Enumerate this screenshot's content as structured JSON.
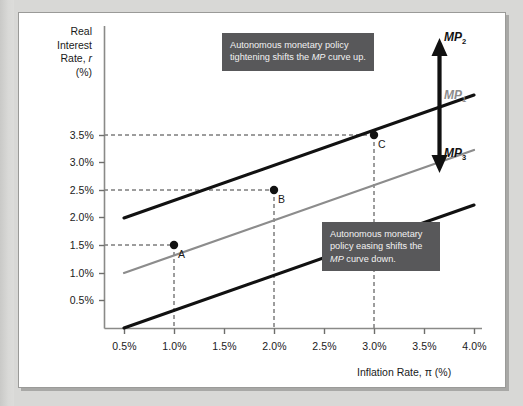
{
  "figure": {
    "y_axis_title_lines": [
      "Real",
      "Interest",
      "Rate, r",
      "(%)"
    ],
    "y_axis_title_italic_part": "r",
    "x_axis_title": "Inflation Rate, π (%)"
  },
  "chart_data": {
    "type": "line",
    "title": "",
    "xlabel": "Inflation Rate, π (%)",
    "ylabel": "Real Interest Rate, r (%)",
    "xlim": [
      0.0,
      4.25
    ],
    "ylim": [
      0.0,
      4.35
    ],
    "xticks": [
      "0.5%",
      "1.0%",
      "1.5%",
      "2.0%",
      "2.5%",
      "3.0%",
      "3.5%",
      "4.0%"
    ],
    "xtick_values": [
      0.5,
      1.0,
      1.5,
      2.0,
      2.5,
      3.0,
      3.5,
      4.0
    ],
    "yticks": [
      "0.5%",
      "1.0%",
      "1.5%",
      "2.0%",
      "2.5%",
      "3.0%",
      "3.5%"
    ],
    "ytick_values": [
      0.5,
      1.0,
      1.5,
      2.0,
      2.5,
      3.0,
      3.5
    ],
    "grid": false,
    "legend_position": "right-inline",
    "series": [
      {
        "name": "MP2",
        "label": "MP",
        "subscript": "2",
        "color": "#111111",
        "width": 3.0,
        "x": [
          0.5,
          4.0
        ],
        "y": [
          2.0,
          4.25
        ],
        "note": "autonomous tightening: shifted up by 1.0 pt from MP1"
      },
      {
        "name": "MP1",
        "label": "MP",
        "subscript": "1",
        "color": "#8c8c8c",
        "width": 2.2,
        "x": [
          0.5,
          4.0
        ],
        "y": [
          1.0,
          3.25
        ],
        "note": "baseline monetary policy curve; contains points A, B, C"
      },
      {
        "name": "MP3",
        "label": "MP",
        "subscript": "3",
        "color": "#111111",
        "width": 3.0,
        "x": [
          0.5,
          4.0
        ],
        "y": [
          0.0,
          2.25
        ],
        "note": "autonomous easing: shifted down by 1.0 pt from MP1"
      }
    ],
    "points": [
      {
        "label": "A",
        "x": 1.0,
        "y": 1.5,
        "on_series": "MP1"
      },
      {
        "label": "B",
        "x": 2.0,
        "y": 2.5,
        "on_series": "MP1"
      },
      {
        "label": "C",
        "x": 3.0,
        "y": 3.5,
        "on_series": "MP1"
      }
    ],
    "guide_lines": [
      {
        "type": "horizontal",
        "y": 1.5,
        "from_x": 0.0,
        "to_x": 1.0
      },
      {
        "type": "horizontal",
        "y": 2.5,
        "from_x": 0.0,
        "to_x": 2.0
      },
      {
        "type": "horizontal",
        "y": 3.5,
        "from_x": 0.0,
        "to_x": 3.0
      },
      {
        "type": "vertical",
        "x": 1.0,
        "from_y": 0.0,
        "to_y": 1.5
      },
      {
        "type": "vertical",
        "x": 2.0,
        "from_y": 0.0,
        "to_y": 2.5
      },
      {
        "type": "vertical",
        "x": 3.0,
        "from_y": 0.0,
        "to_y": 3.5
      }
    ],
    "annotations": [
      {
        "id": "tightening",
        "text_lines": [
          "Autonomous monetary policy",
          "tightening shifts the MP curve up."
        ],
        "italic_token": "MP",
        "box_color": "#58585a",
        "text_color": "#f2f2f2"
      },
      {
        "id": "easing",
        "text_lines": [
          "Autonomous monetary",
          "policy easing shifts the",
          "MP curve down."
        ],
        "italic_token": "MP",
        "box_color": "#58585a",
        "text_color": "#f2f2f2"
      }
    ],
    "arrows": [
      {
        "id": "shift-arrow",
        "style": "double-headed-vertical",
        "color": "#111111",
        "meaning": "MP curve shifts up with tightening and down with easing"
      }
    ]
  },
  "colors": {
    "page_background": "#d8d8d6",
    "panel_background": "#ffffff",
    "panel_border": "#9a9a98",
    "axis": "#8a8a88",
    "curve_black": "#111111",
    "curve_gray": "#8c8c8c",
    "callout_background": "#58585a",
    "callout_text": "#f2f2f2",
    "text": "#1a1a1a"
  }
}
